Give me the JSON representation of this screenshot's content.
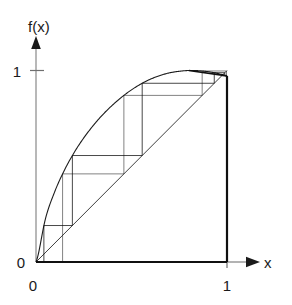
{
  "figure": {
    "title": "",
    "background_color": "#ffffff",
    "line_color": "#101010",
    "axis_color": "#8a8a8a",
    "tick_color": "#6a6a6a"
  },
  "axes": {
    "y_axis_label": "f(x)",
    "x_axis_label": "x",
    "y_ticks": [
      {
        "value": 1,
        "label": "1"
      },
      {
        "value": 0,
        "label": "0"
      }
    ],
    "x_ticks": [
      {
        "value": 0,
        "label": "0"
      },
      {
        "value": 1,
        "label": "1"
      }
    ],
    "y_origin_label": "0",
    "x_origin_label": "0",
    "x_max_label": "1",
    "y_max_label": "1",
    "arrow_heads": {
      "x_axis": "arrow-right-icon",
      "y_axis": "arrow-up-icon"
    }
  },
  "chart_data": {
    "type": "line",
    "title": "",
    "subtitle": "",
    "xlabel": "x",
    "ylabel": "f(x)",
    "xlim": [
      0,
      1
    ],
    "ylim": [
      0,
      1
    ],
    "grid": false,
    "legend": "none",
    "series": [
      {
        "name": "map",
        "type": "curve",
        "function": "sin(pi*x/2)^0.5-like concave map",
        "x": [
          0.0,
          0.05,
          0.1,
          0.15,
          0.2,
          0.25,
          0.3,
          0.35,
          0.4,
          0.45,
          0.5,
          0.55,
          0.6,
          0.65,
          0.7,
          0.75,
          0.8,
          0.85,
          0.9,
          0.95,
          1.0
        ],
        "y": [
          0.0,
          0.228,
          0.372,
          0.482,
          0.572,
          0.648,
          0.713,
          0.77,
          0.819,
          0.862,
          0.899,
          0.93,
          0.955,
          0.974,
          0.988,
          0.996,
          1.0,
          0.999,
          0.994,
          0.985,
          0.972
        ]
      },
      {
        "name": "diagonal",
        "type": "line",
        "function": "y = x",
        "x": [
          0,
          1
        ],
        "y": [
          0,
          1
        ]
      },
      {
        "name": "orbit",
        "type": "cobweb",
        "seed": 0.0413,
        "iterations": 420,
        "fixed_point": [
          0.738,
          0.738
        ]
      }
    ]
  }
}
